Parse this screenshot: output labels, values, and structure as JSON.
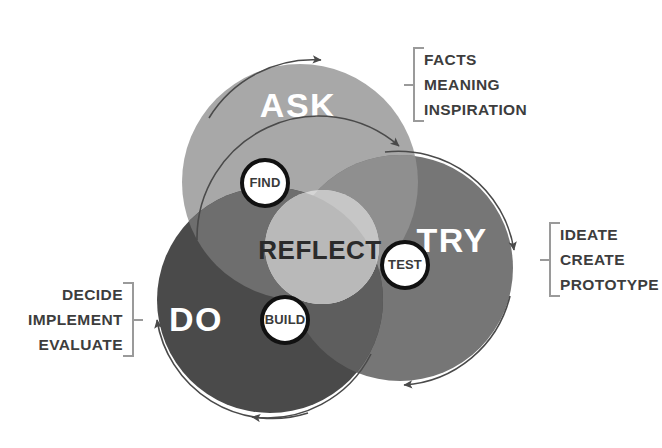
{
  "diagram": {
    "center": {
      "label": "REFLECT",
      "color": "#d5d5d5"
    },
    "circles": [
      {
        "id": "ask",
        "label": "ASK",
        "color": "#a8a8a8",
        "cx": 300,
        "cy": 182,
        "r": 118
      },
      {
        "id": "try",
        "label": "TRY",
        "color": "#767676",
        "cx": 400,
        "cy": 268,
        "r": 113
      },
      {
        "id": "do",
        "label": "DO",
        "color": "#4a4a4a",
        "cx": 270,
        "cy": 300,
        "r": 113
      }
    ],
    "badges": [
      {
        "id": "find",
        "label": "FIND",
        "cx": 265,
        "cy": 183,
        "r": 23
      },
      {
        "id": "test",
        "label": "TEST",
        "cx": 405,
        "cy": 265,
        "r": 23
      },
      {
        "id": "build",
        "label": "BUILD",
        "cx": 285,
        "cy": 320,
        "r": 23
      }
    ],
    "annotations": [
      {
        "id": "facts",
        "for": "ask",
        "bracket_side": "left",
        "lines": [
          "FACTS",
          "MEANING",
          "INSPIRATION"
        ]
      },
      {
        "id": "ideate",
        "for": "try",
        "bracket_side": "left",
        "lines": [
          "IDEATE",
          "CREATE",
          "PROTOTYPE"
        ]
      },
      {
        "id": "decide",
        "for": "do",
        "bracket_side": "right",
        "lines": [
          "DECIDE",
          "IMPLEMENT",
          "EVALUATE"
        ]
      }
    ],
    "arrows": {
      "description": "Each main circle is encircled by a thin arc arrow indicating a cyclical flow",
      "color": "#4a4a4a"
    },
    "colors": {
      "background": "#ffffff",
      "ask_fill": "#a8a8a8",
      "try_fill": "#767676",
      "do_fill": "#4a4a4a",
      "reflect_fill": "#d5d5d5",
      "badge_fill": "#ffffff",
      "badge_stroke": "#111111",
      "bracket": "#9a9a9a",
      "annot_text": "#3d3d3d"
    }
  }
}
